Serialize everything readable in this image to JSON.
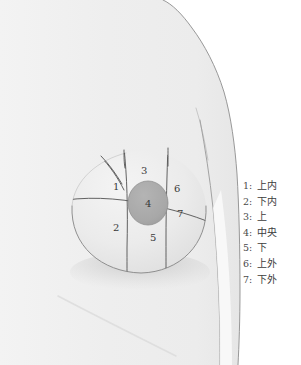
{
  "figure": {
    "type": "breast-quadrant-anatomy-diagram",
    "colors": {
      "background": "#ffffff",
      "skin": "#f0f0f0",
      "skin_shade": "#e8e8e8",
      "breast_fill": "#ededed",
      "breast_shadow": "#d9d9d9",
      "areola_fill": "#a8a8a8",
      "outline": "#6e6e6e",
      "zone_line": "#5a5a5a",
      "label_text": "#3a3a3a"
    },
    "zones": [
      {
        "id": "1",
        "number": "1",
        "name": "upper-inner",
        "label_x": 113,
        "label_y": 187
      },
      {
        "id": "2",
        "number": "2",
        "name": "lower-inner",
        "label_x": 113,
        "label_y": 228
      },
      {
        "id": "3",
        "number": "3",
        "name": "upper",
        "label_x": 141,
        "label_y": 171
      },
      {
        "id": "4",
        "number": "4",
        "name": "central",
        "label_x": 148,
        "label_y": 206
      },
      {
        "id": "5",
        "number": "5",
        "name": "lower",
        "label_x": 150,
        "label_y": 237
      },
      {
        "id": "6",
        "number": "6",
        "name": "upper-outer",
        "label_x": 174,
        "label_y": 188
      },
      {
        "id": "7",
        "number": "7",
        "name": "lower-outer",
        "label_x": 177,
        "label_y": 213
      }
    ]
  },
  "legend": {
    "items": [
      {
        "key": "1:",
        "term": "上内"
      },
      {
        "key": "2:",
        "term": "下内"
      },
      {
        "key": "3:",
        "term": "上"
      },
      {
        "key": "4:",
        "term": "中央"
      },
      {
        "key": "5:",
        "term": "下"
      },
      {
        "key": "6:",
        "term": "上外"
      },
      {
        "key": "7:",
        "term": "下外"
      }
    ]
  }
}
